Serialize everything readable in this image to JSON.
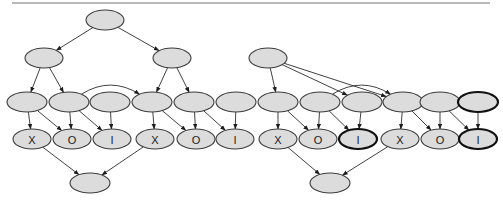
{
  "diagram": {
    "type": "directed-acyclic-graph",
    "canvas": {
      "width": 503,
      "height": 209,
      "background": "#ffffff"
    },
    "style": {
      "node_fill": "#dcdcdc",
      "node_stroke": "#3c3c3c",
      "bold_node_stroke": "#111111",
      "edge_color": "#2b2b2b",
      "label_color": "#1a1a1a"
    },
    "top_rule": {
      "x": 12,
      "y": 2,
      "width": 478,
      "height": 2,
      "color": "#b9b9b9"
    },
    "nodes": [
      {
        "id": "n1",
        "label": "",
        "cx": 105,
        "cy": 20,
        "rx": 19,
        "ry": 10,
        "row": 1,
        "bold": false
      },
      {
        "id": "n2",
        "label": "",
        "cx": 44,
        "cy": 58,
        "rx": 19,
        "ry": 10,
        "row": 2,
        "bold": false
      },
      {
        "id": "n3",
        "label": "",
        "cx": 172,
        "cy": 58,
        "rx": 19,
        "ry": 10,
        "row": 2,
        "bold": false
      },
      {
        "id": "n4",
        "label": "",
        "cx": 268,
        "cy": 58,
        "rx": 19,
        "ry": 10,
        "row": 2,
        "bold": false
      },
      {
        "id": "n5",
        "label": "",
        "cx": 27,
        "cy": 102,
        "rx": 20,
        "ry": 10,
        "row": 3,
        "bold": false
      },
      {
        "id": "n6",
        "label": "",
        "cx": 69,
        "cy": 102,
        "rx": 20,
        "ry": 10,
        "row": 3,
        "bold": false
      },
      {
        "id": "n7",
        "label": "",
        "cx": 110,
        "cy": 102,
        "rx": 20,
        "ry": 10,
        "row": 3,
        "bold": false
      },
      {
        "id": "n8",
        "label": "",
        "cx": 152,
        "cy": 102,
        "rx": 20,
        "ry": 10,
        "row": 3,
        "bold": false
      },
      {
        "id": "n9",
        "label": "",
        "cx": 194,
        "cy": 102,
        "rx": 20,
        "ry": 10,
        "row": 3,
        "bold": false
      },
      {
        "id": "n10",
        "label": "",
        "cx": 236,
        "cy": 102,
        "rx": 20,
        "ry": 10,
        "row": 3,
        "bold": false
      },
      {
        "id": "n11",
        "label": "",
        "cx": 278,
        "cy": 102,
        "rx": 20,
        "ry": 10,
        "row": 3,
        "bold": false
      },
      {
        "id": "n12",
        "label": "",
        "cx": 320,
        "cy": 102,
        "rx": 20,
        "ry": 10,
        "row": 3,
        "bold": false
      },
      {
        "id": "n13",
        "label": "",
        "cx": 362,
        "cy": 102,
        "rx": 20,
        "ry": 10,
        "row": 3,
        "bold": false
      },
      {
        "id": "n14",
        "label": "",
        "cx": 403,
        "cy": 102,
        "rx": 20,
        "ry": 10,
        "row": 3,
        "bold": false
      },
      {
        "id": "n15",
        "label": "",
        "cx": 440,
        "cy": 102,
        "rx": 20,
        "ry": 10,
        "row": 3,
        "bold": false
      },
      {
        "id": "n16",
        "label": "",
        "cx": 478,
        "cy": 102,
        "rx": 20,
        "ry": 10,
        "row": 3,
        "bold": true
      },
      {
        "id": "l1",
        "label": "X",
        "cx": 32,
        "cy": 139,
        "rx": 19,
        "ry": 10,
        "row": 4,
        "bold": false
      },
      {
        "id": "l2",
        "label": "O",
        "cx": 72,
        "cy": 139,
        "rx": 19,
        "ry": 10,
        "row": 4,
        "bold": false
      },
      {
        "id": "l3",
        "label": "I",
        "cx": 112,
        "cy": 139,
        "rx": 19,
        "ry": 10,
        "row": 4,
        "bold": false
      },
      {
        "id": "l4",
        "label": "X",
        "cx": 155,
        "cy": 139,
        "rx": 19,
        "ry": 10,
        "row": 4,
        "bold": false
      },
      {
        "id": "l5",
        "label": "O",
        "cx": 196,
        "cy": 139,
        "rx": 19,
        "ry": 10,
        "row": 4,
        "bold": false
      },
      {
        "id": "l6",
        "label": "I",
        "cx": 235,
        "cy": 139,
        "rx": 19,
        "ry": 10,
        "row": 4,
        "bold": false
      },
      {
        "id": "l7",
        "label": "X",
        "cx": 278,
        "cy": 139,
        "rx": 19,
        "ry": 10,
        "row": 4,
        "bold": false
      },
      {
        "id": "l8",
        "label": "O",
        "cx": 318,
        "cy": 139,
        "rx": 19,
        "ry": 10,
        "row": 4,
        "bold": false
      },
      {
        "id": "l9",
        "label": "I",
        "cx": 358,
        "cy": 139,
        "rx": 19,
        "ry": 10,
        "row": 4,
        "bold": true
      },
      {
        "id": "l10",
        "label": "X",
        "cx": 400,
        "cy": 139,
        "rx": 19,
        "ry": 10,
        "row": 4,
        "bold": false
      },
      {
        "id": "l11",
        "label": "O",
        "cx": 440,
        "cy": 139,
        "rx": 19,
        "ry": 10,
        "row": 4,
        "bold": false
      },
      {
        "id": "l12",
        "label": "I",
        "cx": 478,
        "cy": 139,
        "rx": 19,
        "ry": 10,
        "row": 4,
        "bold": true
      },
      {
        "id": "b1",
        "label": "",
        "cx": 90,
        "cy": 183,
        "rx": 20,
        "ry": 10,
        "row": 5,
        "bold": false
      },
      {
        "id": "b2",
        "label": "",
        "cx": 330,
        "cy": 183,
        "rx": 20,
        "ry": 10,
        "row": 5,
        "bold": false
      }
    ],
    "edges": [
      {
        "from": "n1",
        "to": "n2",
        "kind": "straight"
      },
      {
        "from": "n1",
        "to": "n3",
        "kind": "straight"
      },
      {
        "from": "n2",
        "to": "n5",
        "kind": "straight"
      },
      {
        "from": "n2",
        "to": "n6",
        "kind": "straight"
      },
      {
        "from": "n3",
        "to": "n8",
        "kind": "straight"
      },
      {
        "from": "n3",
        "to": "n9",
        "kind": "straight"
      },
      {
        "from": "n6",
        "to": "n8",
        "kind": "curve"
      },
      {
        "from": "n4",
        "to": "n11",
        "kind": "straight"
      },
      {
        "from": "n4",
        "to": "n13",
        "kind": "straight"
      },
      {
        "from": "n4",
        "to": "n14",
        "kind": "straight"
      },
      {
        "from": "n12",
        "to": "n14",
        "kind": "curve"
      },
      {
        "from": "n5",
        "to": "l1",
        "kind": "straight"
      },
      {
        "from": "n5",
        "to": "l2",
        "kind": "straight"
      },
      {
        "from": "n6",
        "to": "l2",
        "kind": "straight"
      },
      {
        "from": "n6",
        "to": "l3",
        "kind": "straight"
      },
      {
        "from": "n7",
        "to": "l3",
        "kind": "straight"
      },
      {
        "from": "n8",
        "to": "l4",
        "kind": "straight"
      },
      {
        "from": "n8",
        "to": "l5",
        "kind": "straight"
      },
      {
        "from": "n9",
        "to": "l5",
        "kind": "straight"
      },
      {
        "from": "n10",
        "to": "l6",
        "kind": "straight"
      },
      {
        "from": "n9",
        "to": "l6",
        "kind": "straight"
      },
      {
        "from": "n11",
        "to": "l7",
        "kind": "straight"
      },
      {
        "from": "n11",
        "to": "l8",
        "kind": "straight"
      },
      {
        "from": "n12",
        "to": "l8",
        "kind": "straight"
      },
      {
        "from": "n13",
        "to": "l9",
        "kind": "straight"
      },
      {
        "from": "n12",
        "to": "l9",
        "kind": "straight"
      },
      {
        "from": "n14",
        "to": "l10",
        "kind": "straight"
      },
      {
        "from": "n14",
        "to": "l11",
        "kind": "straight"
      },
      {
        "from": "n15",
        "to": "l11",
        "kind": "straight"
      },
      {
        "from": "n16",
        "to": "l12",
        "kind": "straight"
      },
      {
        "from": "n15",
        "to": "l12",
        "kind": "straight"
      },
      {
        "from": "l1",
        "to": "b1",
        "kind": "straight"
      },
      {
        "from": "l4",
        "to": "b1",
        "kind": "straight"
      },
      {
        "from": "l7",
        "to": "b2",
        "kind": "straight"
      },
      {
        "from": "l10",
        "to": "b2",
        "kind": "straight"
      }
    ]
  }
}
